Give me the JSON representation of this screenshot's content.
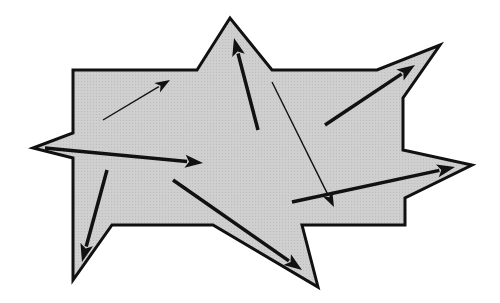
{
  "diagram": {
    "colors": {
      "fill": "#cccccc",
      "stroke": "#111111",
      "background": "#ffffff"
    },
    "polygon": {
      "points": [
        [
          73,
          70
        ],
        [
          197,
          70
        ],
        [
          230,
          18
        ],
        [
          272,
          70
        ],
        [
          377,
          70
        ],
        [
          440,
          45
        ],
        [
          403,
          98
        ],
        [
          403,
          150
        ],
        [
          472,
          165
        ],
        [
          405,
          198
        ],
        [
          405,
          225
        ],
        [
          302,
          225
        ],
        [
          318,
          287
        ],
        [
          213,
          225
        ],
        [
          112,
          225
        ],
        [
          73,
          280
        ],
        [
          73,
          158
        ],
        [
          33,
          148
        ],
        [
          73,
          133
        ]
      ],
      "stroke_width": 3
    },
    "arrows": [
      {
        "from": [
          103,
          120
        ],
        "to": [
          170,
          80
        ],
        "weight": "thin"
      },
      {
        "from": [
          258,
          130
        ],
        "to": [
          234,
          38
        ],
        "weight": "thick"
      },
      {
        "from": [
          272,
          82
        ],
        "to": [
          334,
          207
        ],
        "weight": "thin"
      },
      {
        "from": [
          325,
          125
        ],
        "to": [
          415,
          65
        ],
        "weight": "thick"
      },
      {
        "from": [
          45,
          148
        ],
        "to": [
          203,
          163
        ],
        "weight": "thick"
      },
      {
        "from": [
          107,
          170
        ],
        "to": [
          82,
          262
        ],
        "weight": "thick"
      },
      {
        "from": [
          173,
          180
        ],
        "to": [
          302,
          270
        ],
        "weight": "thick"
      },
      {
        "from": [
          292,
          202
        ],
        "to": [
          455,
          167
        ],
        "weight": "thick"
      }
    ]
  }
}
